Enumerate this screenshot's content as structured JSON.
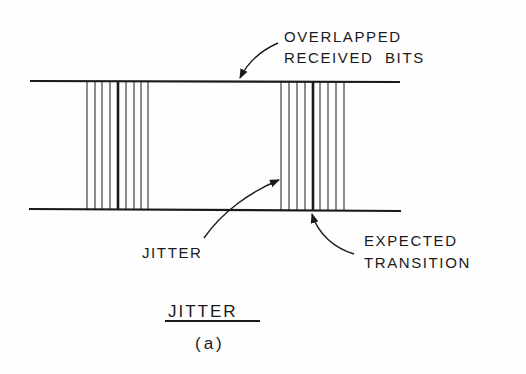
{
  "diagram": {
    "labels": {
      "overlapped_line1": "OVERLAPPED",
      "overlapped_line2": "RECEIVED  BITS",
      "jitter": "JITTER",
      "expected_line1": "EXPECTED",
      "expected_line2": "TRANSITION"
    },
    "title": "JITTER",
    "caption": "(a)",
    "colors": {
      "ink": "#1a1a1a",
      "paper": "#fefefe"
    },
    "rails": {
      "top": {
        "x1": 30,
        "x2": 400,
        "y": 81
      },
      "bottom": {
        "x1": 29,
        "x2": 401,
        "y": 209
      }
    },
    "clusters": [
      {
        "name": "left-transition-cluster",
        "lines_x": [
          87,
          95,
          102,
          110,
          118,
          126,
          134,
          141,
          148
        ],
        "expected_index": 4
      },
      {
        "name": "right-transition-cluster",
        "lines_x": [
          281,
          289,
          297,
          305,
          313,
          320,
          328,
          336,
          344
        ],
        "expected_index": 4
      }
    ]
  }
}
